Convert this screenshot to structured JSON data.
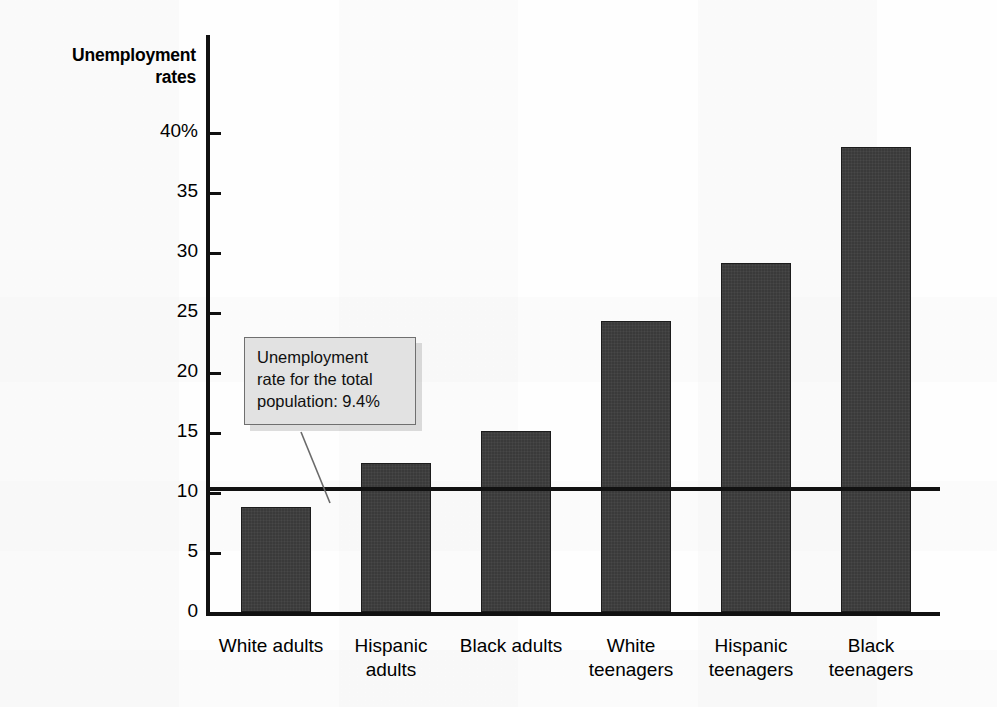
{
  "chart_data": {
    "type": "bar",
    "title": "Unemployment rates",
    "axis_title_text": "Unemployment\nrates",
    "xlabel": "",
    "ylabel": "Unemployment rates",
    "ylim": [
      0,
      40
    ],
    "grid": false,
    "legend": "none",
    "categories": [
      "White adults",
      "Hispanic\nadults",
      "Black adults",
      "White\nteenagers",
      "Hispanic\nteenagers",
      "Black\nteenagers"
    ],
    "values": [
      8.1,
      11.5,
      14.0,
      22.5,
      27.0,
      36.0
    ],
    "value_unit": "percent",
    "y_ticks": [
      0,
      5,
      10,
      15,
      20,
      25,
      30,
      35,
      40
    ],
    "y_tick_labels": [
      "0",
      "5",
      "10",
      "15",
      "20",
      "25",
      "30",
      "35",
      "40%"
    ],
    "reference_line": {
      "value": 9.4,
      "label": "Unemployment rate for the total population: 9.4%"
    },
    "annotation": {
      "text": "Unemployment rate for the total population: 9.4%",
      "line1": "Unemployment",
      "line2": "rate for the total",
      "line3": "population: 9.4%"
    },
    "colors": {
      "bar_fill": "#3a3a3a",
      "bar_border": "#1c1c1c",
      "axis": "#111111",
      "callout_fill": "#e2e2e2",
      "callout_border": "#6f6f6f",
      "background": "#ffffff"
    }
  }
}
